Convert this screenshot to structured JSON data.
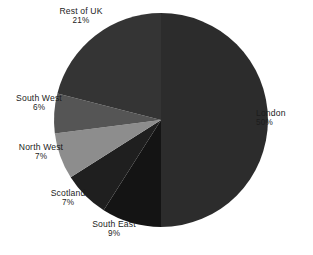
{
  "chart_data": {
    "type": "pie",
    "title": "",
    "subtitle": "",
    "xlabel": "",
    "ylabel": "",
    "legend_position": "none",
    "grid": false,
    "labels_show_percent": true,
    "start_angle_deg": 0,
    "direction": "clockwise",
    "categories": [
      "London",
      "South East",
      "Scotland",
      "North West",
      "South West",
      "Rest of UK"
    ],
    "values": [
      50,
      9,
      7,
      7,
      6,
      21
    ],
    "units": "%",
    "slices": [
      {
        "label": "London",
        "percent_text": "50%",
        "value": 50,
        "color": "#2c2c2c"
      },
      {
        "label": "South East",
        "percent_text": "9%",
        "value": 9,
        "color": "#141414"
      },
      {
        "label": "Scotland",
        "percent_text": "7%",
        "value": 7,
        "color": "#1f1f1f"
      },
      {
        "label": "North West",
        "percent_text": "7%",
        "value": 7,
        "color": "#8d8d8d"
      },
      {
        "label": "South West",
        "percent_text": "6%",
        "value": 6,
        "color": "#555555"
      },
      {
        "label": "Rest of UK",
        "percent_text": "21%",
        "value": 21,
        "color": "#343434"
      }
    ]
  },
  "labels": {
    "rest_of_uk": {
      "name": "Rest of UK",
      "percent": "21%"
    },
    "london": {
      "name": "London",
      "percent": "50%"
    },
    "south_west": {
      "name": "South West",
      "percent": "6%"
    },
    "north_west": {
      "name": "North West",
      "percent": "7%"
    },
    "scotland": {
      "name": "Scotland",
      "percent": "7%"
    },
    "south_east": {
      "name": "South East",
      "percent": "9%"
    }
  },
  "geometry": {
    "center_x": 161,
    "center_y": 120,
    "radius": 107
  },
  "colors": {
    "background": "#ffffff",
    "text": "#1c1c1c"
  }
}
